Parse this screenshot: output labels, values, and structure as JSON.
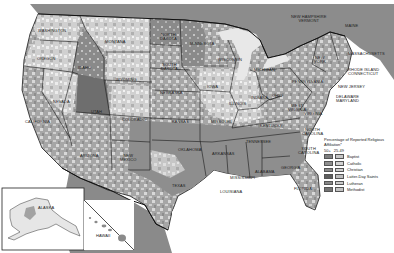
{
  "map": {
    "subject": "Religious affiliation by county, United States",
    "colors": {
      "ocean": "#ffffff",
      "canada": "#8a8a8a",
      "mexico": "#8c8c8c",
      "border": "#1a1a1a",
      "light_fill": "#d4d4d4",
      "medium_fill": "#a8a8a8",
      "dark_fill": "#787878",
      "utah_fill": "#6a6a6a"
    },
    "state_labels": {
      "washington": "WASHINGTON",
      "oregon": "OREGON",
      "california": "CALIFORNIA",
      "nevada": "NEVADA",
      "idaho": "IDAHO",
      "montana": "MONTANA",
      "wyoming": "WYOMING",
      "utah": "UTAH",
      "arizona": "ARIZONA",
      "colorado": "COLORADO",
      "new_mexico": "NEW\nMEXICO",
      "north_dakota": "NORTH\nDAKOTA",
      "south_dakota": "SOUTH\nDAKOTA",
      "nebraska": "NEBRASKA",
      "kansas": "KANSAS",
      "oklahoma": "OKLAHOMA",
      "texas": "TEXAS",
      "minnesota": "MINNESOTA",
      "iowa": "IOWA",
      "missouri": "MISSOURI",
      "arkansas": "ARKANSAS",
      "louisiana": "LOUISIANA",
      "wisconsin": "WISCONSIN",
      "illinois": "ILLINOIS",
      "michigan": "MICHIGAN",
      "indiana": "INDIANA",
      "ohio": "OHIO",
      "kentucky": "KENTUCKY",
      "tennessee": "TENNESSEE",
      "mississippi": "MISSISSIPPI",
      "alabama": "ALABAMA",
      "georgia": "GEORGIA",
      "florida": "FLORIDA",
      "south_carolina": "SOUTH\nCAROLINA",
      "north_carolina": "NORTH\nCAROLINA",
      "virginia": "VIRGINIA",
      "west_virginia": "WEST\nVIRGINIA",
      "pennsylvania": "PENNSYLVANIA",
      "new_york": "NEW\nYORK",
      "new_jersey": "NEW JERSEY",
      "delaware_maryland": "DELAWARE\nMARYLAND",
      "new_hampshire_vermont": "NEW HAMPSHIRE\nVERMONT",
      "maine": "MAINE",
      "massachusetts": "MASSACHUSETTS",
      "rhode_island_connecticut": "RHODE ISLAND\nCONNECTICUT",
      "alaska": "ALASKA",
      "hawaii": "HAWAII"
    }
  },
  "legend": {
    "title": "Percentage of Reported Religious Affiliation*",
    "column_headers": [
      "50+",
      "25-49"
    ],
    "items": [
      {
        "label": "Baptist",
        "dark": "#7e7e7e",
        "light": "#c6c6c6"
      },
      {
        "label": "Catholic",
        "dark": "#8e8e8e",
        "light": "#d2d2d2"
      },
      {
        "label": "Christian",
        "dark": "#8a8a8a",
        "light": "#cfcfcf"
      },
      {
        "label": "Latter-Day Saints",
        "dark": "#5e5e5e",
        "light": "#bdbdbd"
      },
      {
        "label": "Lutheran",
        "dark": "#878787",
        "light": "#cbcbcb"
      },
      {
        "label": "Methodist",
        "dark": "#747474",
        "light": "#c2c2c2"
      }
    ]
  }
}
